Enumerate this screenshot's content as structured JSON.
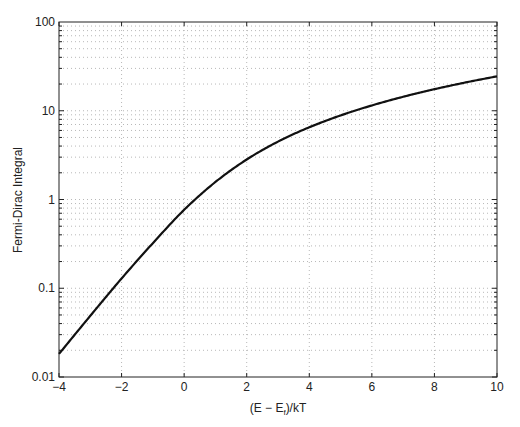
{
  "chart_data": {
    "type": "line",
    "title": "",
    "xlabel": "(E - E_f)/kT",
    "ylabel": "Fermi-Dirac Integral",
    "xlim": [
      -4,
      10
    ],
    "ylim": [
      0.01,
      100
    ],
    "yscale": "log",
    "grid": true,
    "legend": null,
    "x_ticks": [
      "-4",
      "-2",
      "0",
      "2",
      "4",
      "6",
      "8",
      "10"
    ],
    "y_ticks": [
      "0.01",
      "0.1",
      "1",
      "10",
      "100"
    ],
    "series": [
      {
        "name": "Fermi-Dirac Integral",
        "color": "#111111",
        "x": [
          -4,
          -3,
          -2,
          -1,
          0,
          1,
          2,
          3,
          4,
          5,
          6,
          7,
          8,
          9,
          10
        ],
        "y": [
          0.0182,
          0.0489,
          0.1288,
          0.3221,
          0.7652,
          1.5756,
          2.8237,
          4.4886,
          6.5115,
          8.8513,
          11.4772,
          14.3654,
          17.4967,
          20.8548,
          24.4256
        ]
      }
    ]
  },
  "labels": {
    "xlabel_main": "(E − E",
    "xlabel_sub": "f",
    "xlabel_end": ")/kT",
    "ylabel": "Fermi-Dirac Integral"
  }
}
